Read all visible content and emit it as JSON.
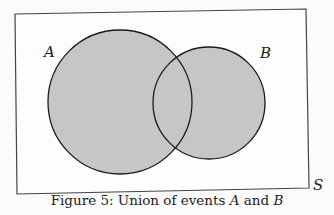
{
  "figure": {
    "caption_prefix": "Figure 5: Union of events ",
    "caption_a": "A",
    "caption_mid": " and ",
    "caption_b": "B",
    "labels": {
      "A": "A",
      "B": "B",
      "S": "S"
    },
    "colors": {
      "fill": "#c6c6c6",
      "stroke": "#1a1a1a",
      "background": "#fbfbfb"
    }
  }
}
